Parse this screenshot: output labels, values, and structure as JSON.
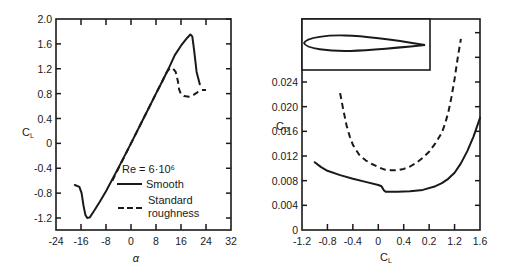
{
  "chart_data": [
    {
      "type": "line",
      "title": "",
      "xlabel": "α",
      "ylabel": "C_L",
      "ylabel_main": "C",
      "ylabel_sub": "L",
      "xlim": [
        -24,
        32
      ],
      "ylim": [
        -1.4,
        2.0
      ],
      "xticks": [
        -24,
        -16,
        -8,
        0,
        8,
        16,
        24,
        32
      ],
      "xtick_labels": [
        "-24",
        "-16",
        "-8",
        "0",
        "8",
        "16",
        "24",
        "32"
      ],
      "yticks": [
        2.0,
        1.6,
        1.2,
        0.8,
        0.4,
        0,
        -0.4,
        -0.8,
        -1.2
      ],
      "ytick_labels": [
        "2.0",
        "1.6",
        "1.2",
        "0.8",
        "0.4",
        "0",
        "-0.4",
        "-0.8",
        "-1.2"
      ],
      "grid": false,
      "legend": {
        "placement": "bottom-right",
        "title": "Re  =  6·10⁶",
        "entries": [
          {
            "label": "Smooth",
            "style": "solid"
          },
          {
            "label": "Standard",
            "label2": "roughness",
            "style": "dashed"
          }
        ]
      },
      "series": [
        {
          "name": "Smooth",
          "style": "solid",
          "x": [
            -18,
            -16.5,
            -15.8,
            -15.2,
            -14.6,
            -14,
            -13.2,
            -12,
            -10,
            -8,
            -4,
            0,
            4,
            8,
            10,
            12,
            14,
            16,
            18,
            19,
            19.6,
            20.2,
            21,
            22
          ],
          "y": [
            -0.67,
            -0.7,
            -0.8,
            -1.0,
            -1.15,
            -1.2,
            -1.19,
            -1.1,
            -0.94,
            -0.77,
            -0.39,
            0.0,
            0.4,
            0.8,
            1.0,
            1.2,
            1.42,
            1.57,
            1.7,
            1.75,
            1.72,
            1.5,
            1.15,
            0.95
          ]
        },
        {
          "name": "Standard roughness",
          "style": "dashed",
          "x": [
            -6,
            -4,
            0,
            4,
            8,
            10,
            11.5,
            12.5,
            13.5,
            14.3,
            15,
            15.4,
            16,
            17,
            18.5,
            20,
            21.5,
            23,
            24
          ],
          "y": [
            -0.6,
            -0.4,
            0.0,
            0.4,
            0.8,
            1.0,
            1.15,
            1.21,
            1.2,
            1.15,
            1.0,
            0.87,
            0.79,
            0.76,
            0.75,
            0.78,
            0.83,
            0.86,
            0.86
          ]
        }
      ]
    },
    {
      "type": "line",
      "title": "",
      "xlabel": "C_L",
      "xlabel_main": "C",
      "xlabel_sub": "L",
      "ylabel": "C_D",
      "ylabel_main": "C",
      "ylabel_sub": "D",
      "xlim": [
        -1.2,
        1.6
      ],
      "ylim": [
        0,
        0.033
      ],
      "xticks": [
        -1.2,
        -0.8,
        -0.4,
        0,
        0.4,
        0.8,
        1.2,
        1.6
      ],
      "xtick_labels": [
        "-1.2",
        "-0.8",
        "-0.4",
        "0",
        "0.4",
        "0.2",
        "1.2",
        "1.6"
      ],
      "yticks": [
        0.024,
        0.02,
        0.016,
        0.012,
        0.008,
        0.004,
        0
      ],
      "ytick_labels": [
        "0.024",
        "0.020",
        "0.016",
        "0.012",
        "0.008",
        "0.004",
        "0"
      ],
      "right_axis_extra_ticks": [
        0.028,
        0.032
      ],
      "grid": false,
      "inset": "airfoil-profile",
      "series": [
        {
          "name": "Smooth",
          "style": "solid",
          "x": [
            -1.0,
            -0.9,
            -0.8,
            -0.6,
            -0.4,
            -0.2,
            0.0,
            0.05,
            0.09,
            0.12,
            0.3,
            0.5,
            0.7,
            0.9,
            1.0,
            1.1,
            1.2,
            1.3,
            1.4,
            1.5,
            1.6
          ],
          "y": [
            0.011,
            0.0102,
            0.0096,
            0.0089,
            0.0083,
            0.0078,
            0.0073,
            0.0071,
            0.0064,
            0.0062,
            0.0062,
            0.0063,
            0.0065,
            0.0071,
            0.0076,
            0.0083,
            0.0093,
            0.0108,
            0.0128,
            0.0152,
            0.0182
          ]
        },
        {
          "name": "Standard roughness",
          "style": "dashed",
          "x": [
            -0.6,
            -0.55,
            -0.5,
            -0.45,
            -0.4,
            -0.3,
            -0.2,
            -0.1,
            0.0,
            0.1,
            0.2,
            0.3,
            0.4,
            0.5,
            0.6,
            0.7,
            0.8,
            0.9,
            1.0,
            1.05,
            1.1,
            1.15,
            1.2,
            1.25,
            1.3
          ],
          "y": [
            0.0222,
            0.0195,
            0.017,
            0.0152,
            0.0138,
            0.0122,
            0.0113,
            0.0107,
            0.0102,
            0.0098,
            0.0097,
            0.0097,
            0.0099,
            0.0103,
            0.0109,
            0.0117,
            0.0127,
            0.0141,
            0.0158,
            0.0172,
            0.019,
            0.0215,
            0.0245,
            0.028,
            0.031
          ]
        }
      ]
    }
  ]
}
